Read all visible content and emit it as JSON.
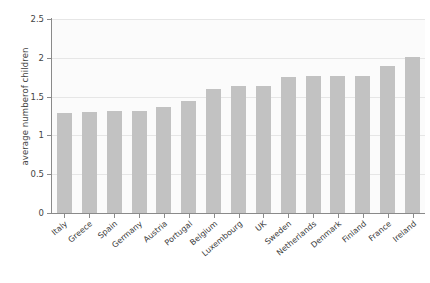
{
  "chart_data": {
    "type": "bar",
    "title": "",
    "xlabel": "",
    "ylabel": "average numberof children",
    "ylim": [
      0,
      2.5
    ],
    "yticks": [
      "0",
      "0.5",
      "1",
      "1.5",
      "2",
      "2.5"
    ],
    "ytick_values": [
      0,
      0.5,
      1,
      1.5,
      2,
      2.5
    ],
    "grid": true,
    "legend": "none",
    "bar_color": "#c2c2c2",
    "plot_background": "#fbfbfb",
    "axis_color": "#8a8a8a",
    "gridline_color": "#e6e6e6",
    "categories": [
      "Italy",
      "Greece",
      "Spain",
      "Germany",
      "Austria",
      "Portugal",
      "Belgium",
      "Luxembourg",
      "UK",
      "Sweden",
      "Netherlands",
      "Denmark",
      "Finland",
      "France",
      "Ireland"
    ],
    "values": [
      1.29,
      1.3,
      1.31,
      1.32,
      1.37,
      1.44,
      1.6,
      1.64,
      1.64,
      1.75,
      1.77,
      1.77,
      1.76,
      1.9,
      2.01
    ]
  }
}
